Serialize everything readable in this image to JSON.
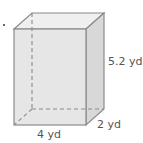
{
  "figure": {
    "type": "rectangular-prism",
    "labels": {
      "height": "5.2 yd",
      "depth": "2 yd",
      "width": "4 yd"
    },
    "colors": {
      "front_face": "#e6e6e6",
      "top_face": "#eeeeee",
      "side_face": "#d6d6d6",
      "edge": "#8a8a8a",
      "hidden_edge": "#8a8a8a",
      "label_text": "#555555"
    }
  }
}
